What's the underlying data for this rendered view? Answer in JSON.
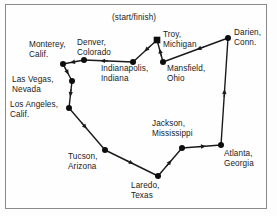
{
  "figure": {
    "type": "route-map-diagram",
    "frame": {
      "border_color": "#8a8a8a",
      "background": "#fefefe"
    },
    "style": {
      "line_color": "#1a1a1a",
      "node_color": "#0d0d0d",
      "text_color": "#1a1a1a",
      "node_radius_px": 3,
      "start_marker_shape": "square"
    }
  },
  "annotations": {
    "start_finish_label": "(start/finish)"
  },
  "nodes": [
    {
      "id": "troy",
      "label": "Troy,\nMichigan",
      "x": 157,
      "y": 40,
      "marker": "square",
      "label_x": 163,
      "label_y": 30,
      "align": "left"
    },
    {
      "id": "darien",
      "label": "Darien,\nConn.",
      "x": 228,
      "y": 38,
      "marker": "circle",
      "label_x": 234,
      "label_y": 28,
      "align": "left"
    },
    {
      "id": "mansfield",
      "label": "Mansfield,\nOhio",
      "x": 163,
      "y": 62,
      "marker": "circle",
      "label_x": 167,
      "label_y": 64,
      "align": "left"
    },
    {
      "id": "indianapolis",
      "label": "Indianapolis,\nIndiana",
      "x": 133,
      "y": 62,
      "marker": "circle",
      "label_x": 101,
      "label_y": 64,
      "align": "left"
    },
    {
      "id": "denver",
      "label": "Denver,\nColorado",
      "x": 84,
      "y": 60,
      "marker": "circle",
      "label_x": 77,
      "label_y": 38,
      "align": "left"
    },
    {
      "id": "monterey",
      "label": "Monterey,\nCalif.",
      "x": 63,
      "y": 64,
      "marker": "circle",
      "label_x": 29,
      "label_y": 40,
      "align": "left"
    },
    {
      "id": "lasvegas",
      "label": "Las Vegas,\nNevada",
      "x": 72,
      "y": 81,
      "marker": "circle",
      "label_x": 12,
      "label_y": 75,
      "align": "left"
    },
    {
      "id": "losangeles",
      "label": "Los Angeles,\nCalif.",
      "x": 69,
      "y": 108,
      "marker": "circle",
      "label_x": 10,
      "label_y": 100,
      "align": "left"
    },
    {
      "id": "tucson",
      "label": "Tucson,\nArizona",
      "x": 105,
      "y": 150,
      "marker": "circle",
      "label_x": 68,
      "label_y": 152,
      "align": "left"
    },
    {
      "id": "laredo",
      "label": "Laredo,\nTexas",
      "x": 158,
      "y": 176,
      "marker": "circle",
      "label_x": 131,
      "label_y": 181,
      "align": "left"
    },
    {
      "id": "jackson",
      "label": "Jackson,\nMississippi",
      "x": 182,
      "y": 148,
      "marker": "circle",
      "label_x": 152,
      "label_y": 119,
      "align": "left"
    },
    {
      "id": "atlanta",
      "label": "Atlanta,\nGeorgia",
      "x": 221,
      "y": 145,
      "marker": "circle",
      "label_x": 224,
      "label_y": 149,
      "align": "left"
    }
  ],
  "legs": [
    {
      "from": "troy",
      "to": "indianapolis",
      "arrow_t": 0.45
    },
    {
      "from": "indianapolis",
      "to": "denver",
      "arrow_t": 0.62
    },
    {
      "from": "denver",
      "to": "monterey",
      "arrow_t": 0.55
    },
    {
      "from": "monterey",
      "to": "lasvegas",
      "arrow_t": 0.5
    },
    {
      "from": "lasvegas",
      "to": "losangeles",
      "arrow_t": 0.5
    },
    {
      "from": "losangeles",
      "to": "tucson",
      "arrow_t": 0.45
    },
    {
      "from": "tucson",
      "to": "laredo",
      "arrow_t": 0.5
    },
    {
      "from": "laredo",
      "to": "jackson",
      "arrow_t": 0.5
    },
    {
      "from": "jackson",
      "to": "atlanta",
      "arrow_t": 0.55
    },
    {
      "from": "atlanta",
      "to": "darien",
      "arrow_t": 0.5
    },
    {
      "from": "darien",
      "to": "mansfield",
      "arrow_t": 0.45
    },
    {
      "from": "mansfield",
      "to": "troy",
      "arrow_t": 0.5
    }
  ],
  "start_finish": {
    "node": "troy",
    "label_x": 112,
    "label_y": 13
  }
}
